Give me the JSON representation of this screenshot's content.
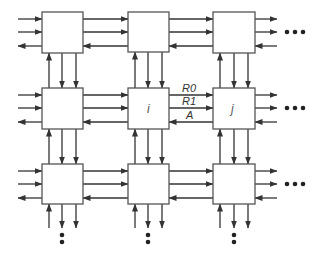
{
  "diagram": {
    "rows": 3,
    "cols": 3,
    "nodes": [
      {
        "row": 0,
        "col": 0,
        "label": ""
      },
      {
        "row": 0,
        "col": 1,
        "label": ""
      },
      {
        "row": 0,
        "col": 2,
        "label": ""
      },
      {
        "row": 1,
        "col": 0,
        "label": ""
      },
      {
        "row": 1,
        "col": 1,
        "label": "i"
      },
      {
        "row": 1,
        "col": 2,
        "label": "j"
      },
      {
        "row": 2,
        "col": 0,
        "label": ""
      },
      {
        "row": 2,
        "col": 1,
        "label": ""
      },
      {
        "row": 2,
        "col": 2,
        "label": ""
      }
    ],
    "link_labels": {
      "r0": "R0",
      "r1": "R1",
      "a": "A"
    },
    "continuation": {
      "horizontal": "•••",
      "vertical": "⋮"
    },
    "colors": {
      "line": "#333333",
      "box_stroke": "#555555",
      "background": "#ffffff"
    }
  }
}
